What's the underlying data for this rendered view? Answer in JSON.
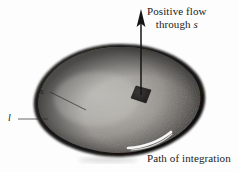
{
  "figure": {
    "type": "vector-field-flux-diagram",
    "background_color": "#fdfdfd",
    "surface": {
      "name": "open-surface-blob",
      "fill_light": "#b9b7b2",
      "fill_mid": "#8d8a85",
      "fill_dark": "#2b2a28",
      "rim_color": "#1c1b1a"
    },
    "patch": {
      "name": "differential-area-patch",
      "color": "#262523"
    },
    "arrow": {
      "name": "flux-arrow",
      "color": "#151414",
      "direction": "up"
    },
    "boundary_curve": {
      "name": "path-of-integration-curve",
      "color": "#fefefe"
    }
  },
  "labels": {
    "positive_flow_line1": "Positive flow",
    "positive_flow_line2_prefix": "through ",
    "positive_flow_line2_symbol": "s",
    "path_of_integration": "Path of integration",
    "surface_symbol": "s",
    "contour_symbol": "l"
  }
}
